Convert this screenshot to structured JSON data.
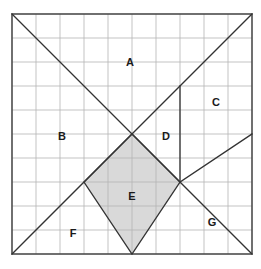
{
  "figure": {
    "background_color": "#ffffff",
    "grid": {
      "columns": 10,
      "rows": 10,
      "cell_size_px": 24,
      "origin_x_px": 12,
      "origin_y_px": 14,
      "line_color": "#b4b4b4",
      "line_width_px": 0.8,
      "border_color": "#4d4d4d",
      "border_width_px": 1.6
    },
    "shading": {
      "fill_color": "#d9d9d9",
      "fill_opacity": 1,
      "stroke_color": "#333333"
    },
    "construct_line": {
      "color": "#333333",
      "width_px": 1.3
    },
    "segments": [
      {
        "name": "main-diagonal",
        "from_grid": [
          0,
          0
        ],
        "to_grid": [
          10,
          10
        ],
        "from_px": [
          12,
          14
        ],
        "to_px": [
          252,
          254
        ]
      },
      {
        "name": "anti-diagonal",
        "from_grid": [
          0,
          10
        ],
        "to_grid": [
          10,
          0
        ],
        "from_px": [
          12,
          254
        ],
        "to_px": [
          252,
          14
        ]
      },
      {
        "name": "vertical-segment",
        "from_grid": [
          7,
          3
        ],
        "to_grid": [
          7,
          7
        ],
        "from_px": [
          180,
          86
        ],
        "to_px": [
          180,
          182
        ]
      },
      {
        "name": "lower-right-diagonal",
        "from_grid": [
          7,
          7
        ],
        "to_grid": [
          10,
          5
        ],
        "from_px": [
          180,
          182
        ],
        "to_px": [
          252,
          134
        ]
      }
    ],
    "shaded_polygon": {
      "name": "region-e-diamond",
      "vertices_grid": [
        [
          5,
          5
        ],
        [
          3,
          7
        ],
        [
          5,
          10
        ],
        [
          7,
          7
        ]
      ],
      "vertices_px": [
        [
          132,
          134
        ],
        [
          84,
          182
        ],
        [
          132,
          254
        ],
        [
          180,
          182
        ]
      ]
    },
    "labels": [
      {
        "id": "A",
        "text": "A",
        "x_px": 130,
        "y_px": 62
      },
      {
        "id": "B",
        "text": "B",
        "x_px": 62,
        "y_px": 136
      },
      {
        "id": "C",
        "text": "C",
        "x_px": 216,
        "y_px": 102
      },
      {
        "id": "D",
        "text": "D",
        "x_px": 166,
        "y_px": 136
      },
      {
        "id": "E",
        "text": "E",
        "x_px": 132,
        "y_px": 196
      },
      {
        "id": "F",
        "text": "F",
        "x_px": 73,
        "y_px": 233
      },
      {
        "id": "G",
        "text": "G",
        "x_px": 212,
        "y_px": 222
      }
    ]
  }
}
